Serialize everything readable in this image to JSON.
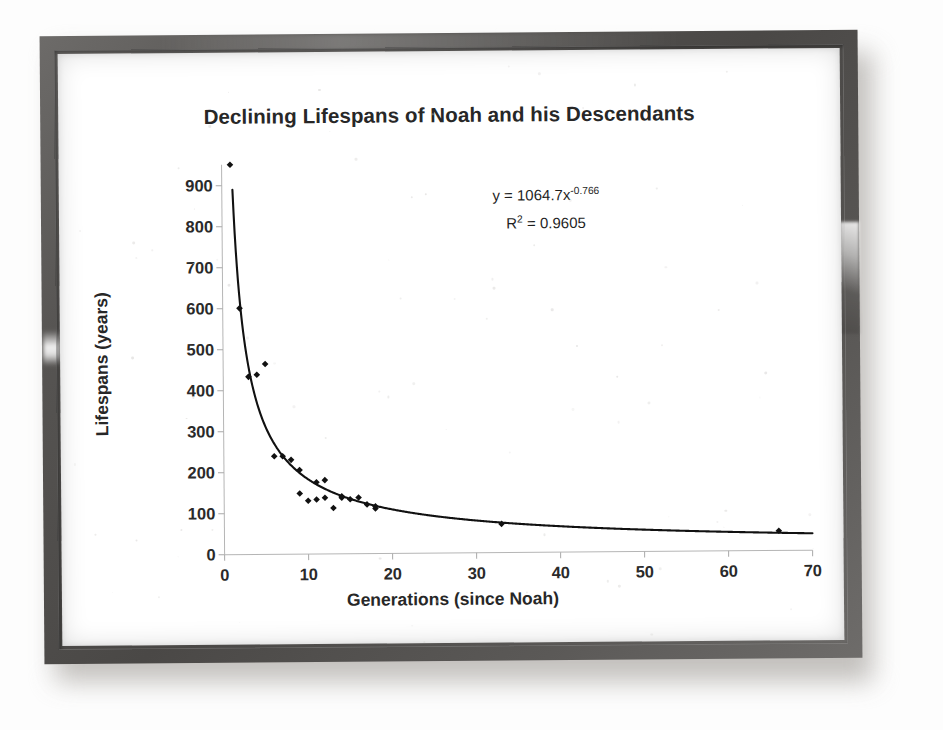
{
  "chart_data": {
    "type": "scatter",
    "title": "Declining Lifespans of Noah and his Descendants",
    "xlabel": "Generations (since Noah)",
    "ylabel": "Lifespans (years)",
    "xlim": [
      0,
      70
    ],
    "ylim": [
      0,
      950
    ],
    "xticks": [
      0,
      10,
      20,
      30,
      40,
      50,
      60,
      70
    ],
    "yticks": [
      0,
      100,
      200,
      300,
      400,
      500,
      600,
      700,
      800,
      900
    ],
    "grid": false,
    "legend": null,
    "marker": "diamond",
    "marker_color": "#111111",
    "trendline": {
      "type": "power",
      "coefficient": 1064.7,
      "exponent": -0.766,
      "equation_label": "y = 1064.7x",
      "equation_exponent": "-0.766",
      "r_squared_label": "R",
      "r_squared_sup": "2",
      "r_squared_value": "= 0.9605",
      "color": "#111111"
    },
    "x": [
      1,
      2,
      3,
      4,
      5,
      6,
      7,
      8,
      9,
      9,
      10,
      11,
      11,
      12,
      12,
      13,
      14,
      14,
      15,
      16,
      17,
      18,
      18,
      33,
      66
    ],
    "y": [
      950,
      600,
      433,
      438,
      464,
      239,
      239,
      230,
      148,
      205,
      130,
      175,
      133,
      180,
      137,
      112,
      140,
      137,
      133,
      137,
      120,
      110,
      115,
      70,
      48
    ],
    "values": [
      {
        "x": 1,
        "y": 950
      },
      {
        "x": 2,
        "y": 600
      },
      {
        "x": 3,
        "y": 433
      },
      {
        "x": 4,
        "y": 438
      },
      {
        "x": 5,
        "y": 464
      },
      {
        "x": 6,
        "y": 239
      },
      {
        "x": 7,
        "y": 239
      },
      {
        "x": 8,
        "y": 230
      },
      {
        "x": 9,
        "y": 148
      },
      {
        "x": 9,
        "y": 205
      },
      {
        "x": 10,
        "y": 130
      },
      {
        "x": 11,
        "y": 175
      },
      {
        "x": 11,
        "y": 133
      },
      {
        "x": 12,
        "y": 180
      },
      {
        "x": 12,
        "y": 137
      },
      {
        "x": 13,
        "y": 112
      },
      {
        "x": 14,
        "y": 140
      },
      {
        "x": 14,
        "y": 137
      },
      {
        "x": 15,
        "y": 133
      },
      {
        "x": 16,
        "y": 137
      },
      {
        "x": 17,
        "y": 120
      },
      {
        "x": 18,
        "y": 110
      },
      {
        "x": 18,
        "y": 115
      },
      {
        "x": 33,
        "y": 70
      },
      {
        "x": 66,
        "y": 48
      }
    ]
  },
  "frame": {
    "border_color": "#4a4846",
    "mat_color": "#ffffff",
    "shadow_color": "#b9b6b2"
  }
}
